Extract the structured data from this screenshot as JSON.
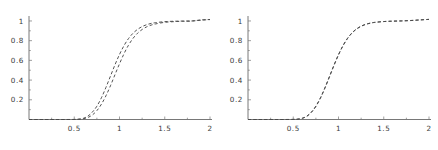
{
  "figure": {
    "name": "two-panel-cdf-comparison",
    "background": "#ffffff",
    "line_color": "#4a4a4a",
    "axis_color": "#555555",
    "label_color": "#3a3a3a"
  },
  "chart_data": [
    {
      "type": "line",
      "panel": "left",
      "title": "",
      "xlabel": "",
      "ylabel": "",
      "xlim": [
        0,
        2
      ],
      "ylim": [
        0,
        1.03
      ],
      "grid": false,
      "legend": null,
      "xticks": [
        0.5,
        1,
        1.5,
        2
      ],
      "xtick_labels": [
        "0.5",
        "1",
        "1.5",
        "2"
      ],
      "yticks": [
        0.2,
        0.4,
        0.6,
        0.8,
        1
      ],
      "ytick_labels": [
        "0.2",
        "0.4",
        "0.6",
        "0.8",
        "1"
      ],
      "linestyle": "dashed",
      "series": [
        {
          "name": "curve-a",
          "x": [
            0.0,
            0.1,
            0.2,
            0.3,
            0.4,
            0.5,
            0.55,
            0.6,
            0.65,
            0.7,
            0.75,
            0.8,
            0.85,
            0.9,
            0.95,
            1.0,
            1.05,
            1.1,
            1.15,
            1.2,
            1.25,
            1.3,
            1.35,
            1.4,
            1.5,
            1.6,
            1.7,
            1.8,
            1.9,
            2.0
          ],
          "values": [
            0.0,
            0.0,
            0.0,
            0.0,
            0.0,
            0.001,
            0.004,
            0.012,
            0.034,
            0.075,
            0.135,
            0.22,
            0.325,
            0.44,
            0.555,
            0.66,
            0.75,
            0.822,
            0.876,
            0.915,
            0.943,
            0.962,
            0.975,
            0.983,
            0.993,
            0.997,
            0.999,
            1.0,
            1.01,
            1.015
          ]
        },
        {
          "name": "curve-b",
          "x": [
            0.0,
            0.1,
            0.2,
            0.3,
            0.4,
            0.5,
            0.55,
            0.6,
            0.65,
            0.7,
            0.75,
            0.8,
            0.85,
            0.9,
            0.95,
            1.0,
            1.05,
            1.1,
            1.15,
            1.2,
            1.25,
            1.3,
            1.35,
            1.4,
            1.5,
            1.6,
            1.7,
            1.8,
            1.9,
            2.0
          ],
          "values": [
            0.0,
            0.0,
            0.0,
            0.0,
            0.0,
            0.0,
            0.002,
            0.007,
            0.02,
            0.046,
            0.09,
            0.155,
            0.24,
            0.342,
            0.455,
            0.565,
            0.668,
            0.755,
            0.824,
            0.876,
            0.913,
            0.94,
            0.958,
            0.97,
            0.986,
            0.993,
            0.997,
            0.999,
            1.008,
            1.014
          ]
        }
      ]
    },
    {
      "type": "line",
      "panel": "right",
      "title": "",
      "xlabel": "",
      "ylabel": "",
      "xlim": [
        0,
        2
      ],
      "ylim": [
        0,
        1.03
      ],
      "grid": false,
      "legend": null,
      "xticks": [
        0.5,
        1,
        1.5,
        2
      ],
      "xtick_labels": [
        "0.5",
        "1",
        "1.5",
        "2"
      ],
      "yticks": [
        0.2,
        0.4,
        0.6,
        0.8,
        1
      ],
      "ytick_labels": [
        "0.2",
        "0.4",
        "0.6",
        "0.8",
        "1"
      ],
      "linestyle": "dashed",
      "series": [
        {
          "name": "curve-a",
          "x": [
            0.0,
            0.1,
            0.2,
            0.3,
            0.4,
            0.5,
            0.55,
            0.6,
            0.65,
            0.7,
            0.75,
            0.8,
            0.85,
            0.9,
            0.95,
            1.0,
            1.05,
            1.1,
            1.15,
            1.2,
            1.25,
            1.3,
            1.35,
            1.4,
            1.5,
            1.6,
            1.7,
            1.8,
            1.9,
            2.0
          ],
          "values": [
            0.0,
            0.0,
            0.0,
            0.0,
            0.0,
            0.001,
            0.004,
            0.012,
            0.032,
            0.072,
            0.132,
            0.215,
            0.318,
            0.432,
            0.548,
            0.655,
            0.748,
            0.822,
            0.878,
            0.918,
            0.946,
            0.965,
            0.977,
            0.985,
            0.994,
            0.998,
            1.0,
            1.004,
            1.01,
            1.016
          ]
        },
        {
          "name": "curve-b",
          "x": [
            0.0,
            0.1,
            0.2,
            0.3,
            0.4,
            0.5,
            0.55,
            0.6,
            0.65,
            0.7,
            0.75,
            0.8,
            0.85,
            0.9,
            0.95,
            1.0,
            1.05,
            1.1,
            1.15,
            1.2,
            1.25,
            1.3,
            1.35,
            1.4,
            1.5,
            1.6,
            1.7,
            1.8,
            1.9,
            2.0
          ],
          "values": [
            0.0,
            0.0,
            0.0,
            0.0,
            0.0,
            0.001,
            0.004,
            0.013,
            0.034,
            0.075,
            0.136,
            0.22,
            0.323,
            0.437,
            0.552,
            0.659,
            0.751,
            0.825,
            0.88,
            0.92,
            0.947,
            0.966,
            0.978,
            0.986,
            0.994,
            0.998,
            1.001,
            1.005,
            1.011,
            1.016
          ]
        }
      ]
    }
  ]
}
